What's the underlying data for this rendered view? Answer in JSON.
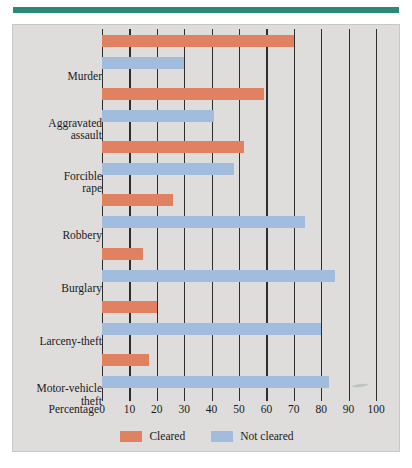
{
  "figure": {
    "top_rule_color": "#2a8a74",
    "panel_background": "#dedddb"
  },
  "axis": {
    "title": "Percentage",
    "ticks": [
      0,
      10,
      20,
      30,
      40,
      50,
      60,
      70,
      80,
      90,
      100
    ],
    "tick_labels": [
      "0",
      "10",
      "20",
      "30",
      "40",
      "50",
      "60",
      "70",
      "80",
      "90",
      "100"
    ]
  },
  "legend": {
    "items": [
      {
        "label": "Cleared",
        "color": "#e08261",
        "key": "cleared"
      },
      {
        "label": "Not cleared",
        "color": "#a2bcdd",
        "key": "not_cleared"
      }
    ]
  },
  "chart_data": {
    "type": "bar",
    "orientation": "horizontal",
    "title": "",
    "xlabel": "Percentage",
    "ylabel": "",
    "xlim": [
      0,
      100
    ],
    "grid": true,
    "legend_position": "bottom",
    "categories": [
      "Murder",
      "Aggravated assault",
      "Forcible rape",
      "Robbery",
      "Burglary",
      "Larceny-theft",
      "Motor-vehicle theft"
    ],
    "category_label_lines": [
      [
        "Murder"
      ],
      [
        "Aggravated",
        "assault"
      ],
      [
        "Forcible",
        "rape"
      ],
      [
        "Robbery"
      ],
      [
        "Burglary"
      ],
      [
        "Larceny-theft"
      ],
      [
        "Motor-vehicle",
        "theft"
      ]
    ],
    "series": [
      {
        "name": "Cleared",
        "color": "#e08261",
        "values": [
          70,
          59,
          52,
          26,
          15,
          20,
          17
        ]
      },
      {
        "name": "Not cleared",
        "color": "#a2bcdd",
        "values": [
          30,
          41,
          48,
          74,
          85,
          80,
          83
        ]
      }
    ]
  }
}
